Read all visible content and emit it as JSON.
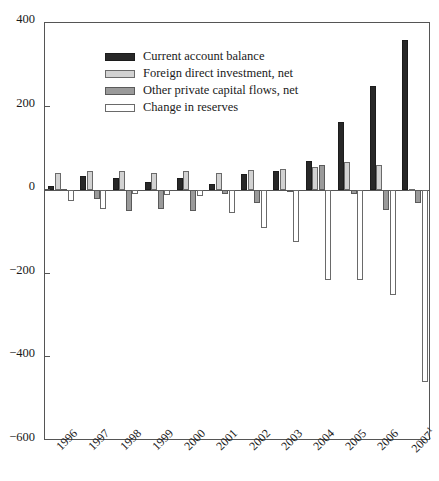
{
  "chart_data": {
    "type": "bar",
    "title": "",
    "subtitle": "",
    "xlabel": "",
    "ylabel": "",
    "grid": false,
    "legend_position": "top-left",
    "ylim": [
      -600,
      400
    ],
    "yticks": [
      400,
      200,
      0,
      -200,
      -400,
      -600
    ],
    "ytick_labels": [
      "400",
      "200",
      "0",
      "−200",
      "−400",
      "−600"
    ],
    "categories": [
      "1996",
      "1997",
      "1998",
      "1999",
      "2000",
      "2001",
      "2002",
      "2003",
      "2004",
      "2005",
      "2006",
      "2007"
    ],
    "category_labels": [
      "1996",
      "1997",
      "1998",
      "1999",
      "2000",
      "2001",
      "2002",
      "2003",
      "2004",
      "2005",
      "2006",
      "2007"
    ],
    "last_category_footnote": "1",
    "series": [
      {
        "name": "Current account balance",
        "color": "#282828",
        "values": [
          10,
          35,
          30,
          20,
          30,
          15,
          38,
          45,
          70,
          162,
          250,
          360
        ]
      },
      {
        "name": "Foreign direct investment, net",
        "color": "#d2d2d2",
        "values": [
          40,
          45,
          45,
          40,
          45,
          40,
          48,
          50,
          55,
          68,
          60,
          4
        ]
      },
      {
        "name": "Other private capital flows, net",
        "color": "#9a9a9a",
        "values": [
          2,
          -20,
          -50,
          -45,
          -50,
          -8,
          -30,
          -5,
          60,
          -8,
          -48,
          -30
        ]
      },
      {
        "name": "Change in reserves",
        "color": "#ffffff",
        "values": [
          -25,
          -45,
          -10,
          -12,
          -15,
          -55,
          -90,
          -125,
          -215,
          -215,
          -250,
          -460
        ]
      }
    ]
  },
  "legend": {
    "items": [
      {
        "label": "Current account balance",
        "swatch": "s0"
      },
      {
        "label": "Foreign direct investment, net",
        "swatch": "s1"
      },
      {
        "label": "Other private capital flows, net",
        "swatch": "s2"
      },
      {
        "label": "Change in reserves",
        "swatch": "s3"
      }
    ]
  }
}
